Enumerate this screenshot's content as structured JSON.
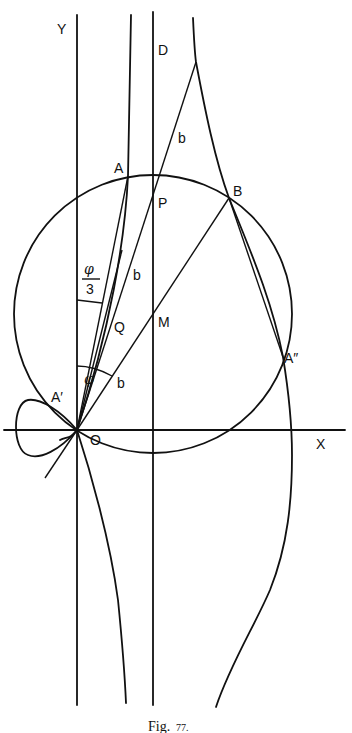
{
  "figure": {
    "caption_main": "Fig.",
    "caption_num": "77.",
    "labels": {
      "y_axis": "Y",
      "x_axis": "X",
      "D": "D",
      "A": "A",
      "B": "B",
      "P": "P",
      "Q": "Q",
      "M": "M",
      "A_prime": "A′",
      "A_double_prime": "A″",
      "O": "O",
      "b_upper": "b",
      "b_middle": "b",
      "b_lower": "b",
      "phi": "φ",
      "phi_over_3_num": "φ",
      "phi_over_3_den": "3"
    },
    "colors": {
      "stroke": "#111111",
      "background": "#ffffff"
    }
  }
}
